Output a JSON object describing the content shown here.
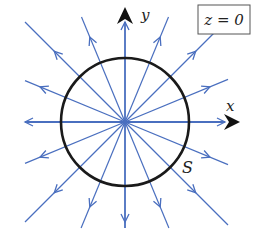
{
  "figure": {
    "plane_label": "z = 0",
    "x_axis_label": "x",
    "y_axis_label": "y",
    "surface_label": "S"
  },
  "geometry": {
    "center": [
      125,
      122
    ],
    "circle_radius": 64,
    "num_field_lines": 16,
    "bounds": {
      "left": 25,
      "right": 228,
      "top": 17,
      "bottom": 228
    },
    "arrow_radius": 92
  },
  "colors": {
    "field_line": "#4a6fbf",
    "circle": "#1a1a1a",
    "axis_arrow": "#111111",
    "box_border": "#555555"
  }
}
